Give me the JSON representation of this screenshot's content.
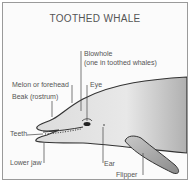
{
  "title": "TOOTHED WHALE",
  "labels": {
    "blowhole": "Blowhole",
    "blowhole_note": "(one in toothed whales)",
    "melon": "Melon or forehead",
    "eye": "Eye",
    "beak": "Beak (rostrum)",
    "teeth": "Teeth",
    "lower_jaw": "Lower jaw",
    "ear": "Ear",
    "flipper": "Flipper"
  },
  "colors": {
    "body_light": "#e8e8e8",
    "body_dark": "#a8a8a8",
    "outline": "#333333",
    "text": "#555555"
  }
}
